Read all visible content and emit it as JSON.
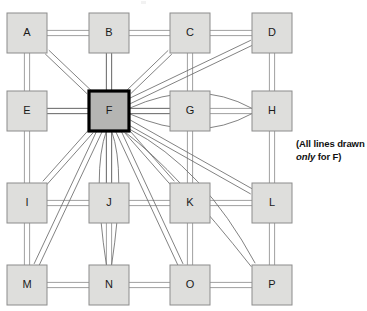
{
  "diagram": {
    "type": "fully-connected-grid-network",
    "title": "",
    "grid": {
      "rows": 4,
      "cols": 4
    },
    "nodes": [
      {
        "id": "A",
        "label": "A",
        "row": 0,
        "col": 0,
        "highlight": false
      },
      {
        "id": "B",
        "label": "B",
        "row": 0,
        "col": 1,
        "highlight": false
      },
      {
        "id": "C",
        "label": "C",
        "row": 0,
        "col": 2,
        "highlight": false
      },
      {
        "id": "D",
        "label": "D",
        "row": 0,
        "col": 3,
        "highlight": false
      },
      {
        "id": "E",
        "label": "E",
        "row": 1,
        "col": 0,
        "highlight": false
      },
      {
        "id": "F",
        "label": "F",
        "row": 1,
        "col": 1,
        "highlight": true
      },
      {
        "id": "G",
        "label": "G",
        "row": 1,
        "col": 2,
        "highlight": false
      },
      {
        "id": "H",
        "label": "H",
        "row": 1,
        "col": 3,
        "highlight": false
      },
      {
        "id": "I",
        "label": "I",
        "row": 2,
        "col": 0,
        "highlight": false
      },
      {
        "id": "J",
        "label": "J",
        "row": 2,
        "col": 1,
        "highlight": false
      },
      {
        "id": "K",
        "label": "K",
        "row": 2,
        "col": 2,
        "highlight": false
      },
      {
        "id": "L",
        "label": "L",
        "row": 2,
        "col": 3,
        "highlight": false
      },
      {
        "id": "M",
        "label": "M",
        "row": 3,
        "col": 0,
        "highlight": false
      },
      {
        "id": "N",
        "label": "N",
        "row": 3,
        "col": 1,
        "highlight": false
      },
      {
        "id": "O",
        "label": "O",
        "row": 3,
        "col": 2,
        "highlight": false
      },
      {
        "id": "P",
        "label": "P",
        "row": 3,
        "col": 3,
        "highlight": false
      }
    ],
    "source_node": "F",
    "links_from_source": [
      "A",
      "B",
      "C",
      "D",
      "E",
      "G",
      "H",
      "I",
      "J",
      "K",
      "L",
      "M",
      "N",
      "O",
      "P"
    ],
    "grid_links": [
      [
        "A",
        "B"
      ],
      [
        "B",
        "C"
      ],
      [
        "C",
        "D"
      ],
      [
        "E",
        "F"
      ],
      [
        "F",
        "G"
      ],
      [
        "G",
        "H"
      ],
      [
        "I",
        "J"
      ],
      [
        "J",
        "K"
      ],
      [
        "K",
        "L"
      ],
      [
        "M",
        "N"
      ],
      [
        "N",
        "O"
      ],
      [
        "O",
        "P"
      ],
      [
        "A",
        "E"
      ],
      [
        "E",
        "I"
      ],
      [
        "I",
        "M"
      ],
      [
        "B",
        "F"
      ],
      [
        "F",
        "J"
      ],
      [
        "J",
        "N"
      ],
      [
        "C",
        "G"
      ],
      [
        "G",
        "K"
      ],
      [
        "K",
        "O"
      ],
      [
        "D",
        "H"
      ],
      [
        "H",
        "L"
      ],
      [
        "L",
        "P"
      ]
    ],
    "colors": {
      "node_fill": "#dededc",
      "node_stroke": "#8c8c8c",
      "highlight_fill": "#b5b5b3",
      "highlight_stroke": "#000000",
      "link_stroke": "#6b6b6b",
      "background": "#ffffff",
      "text": "#111111"
    },
    "geometry": {
      "node_size": 40,
      "col_x": [
        7,
        89,
        170,
        252
      ],
      "row_y": [
        13,
        91,
        183,
        265
      ],
      "link_offset": 2.6
    }
  },
  "legend": {
    "line1_prefix": "(All lines drawn",
    "line2_italic": "only",
    "line2_suffix": " for F)"
  }
}
